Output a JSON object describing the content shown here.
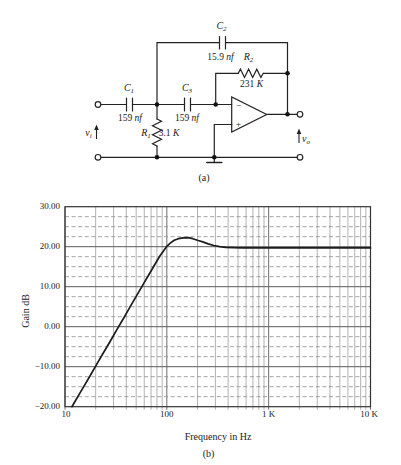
{
  "figure": {
    "caption_a": "(a)",
    "caption_b": "(b)"
  },
  "circuit": {
    "components": {
      "c1": {
        "symbol": "C",
        "sub": "1",
        "value": "159",
        "unit": "nf"
      },
      "c2": {
        "symbol": "C",
        "sub": "2",
        "value": "15.9",
        "unit": "nf"
      },
      "c3": {
        "symbol": "C",
        "sub": "3",
        "value": "159",
        "unit": "nf"
      },
      "r1": {
        "symbol": "R",
        "sub": "1",
        "value": "3.1",
        "unit": "K"
      },
      "r2": {
        "symbol": "R",
        "sub": "2",
        "value": "231",
        "unit": "K"
      }
    },
    "ports": {
      "input": {
        "symbol": "v",
        "sub": "i"
      },
      "output": {
        "symbol": "v",
        "sub": "o"
      }
    },
    "opamp": {
      "minus_label": "−",
      "plus_label": "+"
    }
  },
  "chart_data": {
    "type": "line",
    "title": "",
    "xlabel": "Frequency in Hz",
    "ylabel": "Gain dB",
    "x_scale": "log",
    "xlim": [
      10,
      10000
    ],
    "ylim": [
      -20,
      30
    ],
    "x_ticks": [
      "10",
      "100",
      "1 K",
      "10 K"
    ],
    "y_ticks": [
      "30.00",
      "20.00",
      "10.00",
      "0.00",
      "−10.00",
      "−20.00"
    ],
    "y_major_step": 10,
    "y_minor_step": 2.5,
    "grid": {
      "x_minor": "solid",
      "x_major": "solid",
      "y_major": "solid",
      "y_minor": "dashed"
    },
    "legend": "none",
    "series": [
      {
        "name": "gain-response",
        "points": [
          [
            11.7,
            -20.0
          ],
          [
            13,
            -18.0
          ],
          [
            14,
            -16.6
          ],
          [
            16,
            -14.1
          ],
          [
            18,
            -11.9
          ],
          [
            21,
            -8.9
          ],
          [
            24,
            -6.4
          ],
          [
            28,
            -3.5
          ],
          [
            32,
            -0.9
          ],
          [
            37,
            1.8
          ],
          [
            43,
            4.7
          ],
          [
            50,
            7.6
          ],
          [
            58,
            10.4
          ],
          [
            67,
            13.1
          ],
          [
            76,
            15.5
          ],
          [
            85,
            17.6
          ],
          [
            92,
            18.8
          ],
          [
            100,
            20.1
          ],
          [
            108,
            20.9
          ],
          [
            118,
            21.6
          ],
          [
            130,
            22.0
          ],
          [
            145,
            22.2
          ],
          [
            162,
            22.25
          ],
          [
            180,
            22.0
          ],
          [
            200,
            21.6
          ],
          [
            225,
            21.2
          ],
          [
            255,
            20.7
          ],
          [
            290,
            20.3
          ],
          [
            330,
            20.0
          ],
          [
            380,
            19.85
          ],
          [
            450,
            19.75
          ],
          [
            550,
            19.7
          ],
          [
            700,
            19.7
          ],
          [
            900,
            19.7
          ],
          [
            1200,
            19.7
          ],
          [
            1800,
            19.7
          ],
          [
            2800,
            19.7
          ],
          [
            4500,
            19.7
          ],
          [
            7000,
            19.7
          ],
          [
            10000,
            19.7
          ]
        ]
      }
    ]
  }
}
